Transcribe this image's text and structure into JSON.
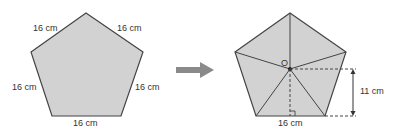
{
  "colors": {
    "fill": "#d2d2d2",
    "stroke": "#444444",
    "arrow": "#8a8a8a",
    "text": "#333333"
  },
  "left_figure": {
    "side_labels": {
      "top_left": "16 cm",
      "top_right": "16 cm",
      "left": "16 cm",
      "right": "16 cm",
      "bottom": "16 cm"
    }
  },
  "arrow": {
    "icon": "right-arrow-icon"
  },
  "right_figure": {
    "center_label": "O",
    "base_label": "16 cm",
    "height_label": "11 cm"
  }
}
